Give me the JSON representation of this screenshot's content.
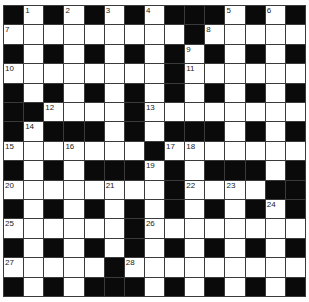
{
  "puzzle": {
    "rows": 15,
    "cols": 15,
    "colors": {
      "black": "#0a0a0a",
      "white": "#ffffff",
      "line": "#3a3a3a"
    },
    "grid": [
      "#.#.#.#.###.#.#",
      ".........#.....",
      "#.#.#.#.#.#.#.#",
      "........#......",
      "#.#.#.#.#.#.#.#",
      "##....#........",
      "#.###.#.###.#.#",
      ".......#.......",
      "#.#.###.#.###.#",
      "........#....##",
      "#.#.#.#.#.#.#.#",
      "......#........",
      "#.#.#.#.#.#.#.#",
      ".....#.........",
      "#.#.###.#.#.#.#"
    ],
    "numbers": [
      {
        "r": 0,
        "c": 1,
        "n": "1"
      },
      {
        "r": 0,
        "c": 3,
        "n": "2"
      },
      {
        "r": 0,
        "c": 5,
        "n": "3"
      },
      {
        "r": 0,
        "c": 7,
        "n": "4"
      },
      {
        "r": 0,
        "c": 11,
        "n": "5"
      },
      {
        "r": 0,
        "c": 13,
        "n": "6"
      },
      {
        "r": 1,
        "c": 0,
        "n": "7"
      },
      {
        "r": 1,
        "c": 10,
        "n": "8"
      },
      {
        "r": 2,
        "c": 9,
        "n": "9"
      },
      {
        "r": 3,
        "c": 0,
        "n": "10"
      },
      {
        "r": 3,
        "c": 9,
        "n": "11"
      },
      {
        "r": 5,
        "c": 2,
        "n": "12"
      },
      {
        "r": 5,
        "c": 7,
        "n": "13"
      },
      {
        "r": 6,
        "c": 1,
        "n": "14"
      },
      {
        "r": 7,
        "c": 0,
        "n": "15"
      },
      {
        "r": 7,
        "c": 3,
        "n": "16"
      },
      {
        "r": 7,
        "c": 8,
        "n": "17"
      },
      {
        "r": 7,
        "c": 9,
        "n": "18"
      },
      {
        "r": 8,
        "c": 7,
        "n": "19"
      },
      {
        "r": 9,
        "c": 0,
        "n": "20"
      },
      {
        "r": 9,
        "c": 5,
        "n": "21"
      },
      {
        "r": 9,
        "c": 9,
        "n": "22"
      },
      {
        "r": 9,
        "c": 11,
        "n": "23"
      },
      {
        "r": 10,
        "c": 13,
        "n": "24"
      },
      {
        "r": 11,
        "c": 0,
        "n": "25"
      },
      {
        "r": 11,
        "c": 7,
        "n": "26"
      },
      {
        "r": 13,
        "c": 0,
        "n": "27"
      },
      {
        "r": 13,
        "c": 6,
        "n": "28"
      }
    ]
  }
}
